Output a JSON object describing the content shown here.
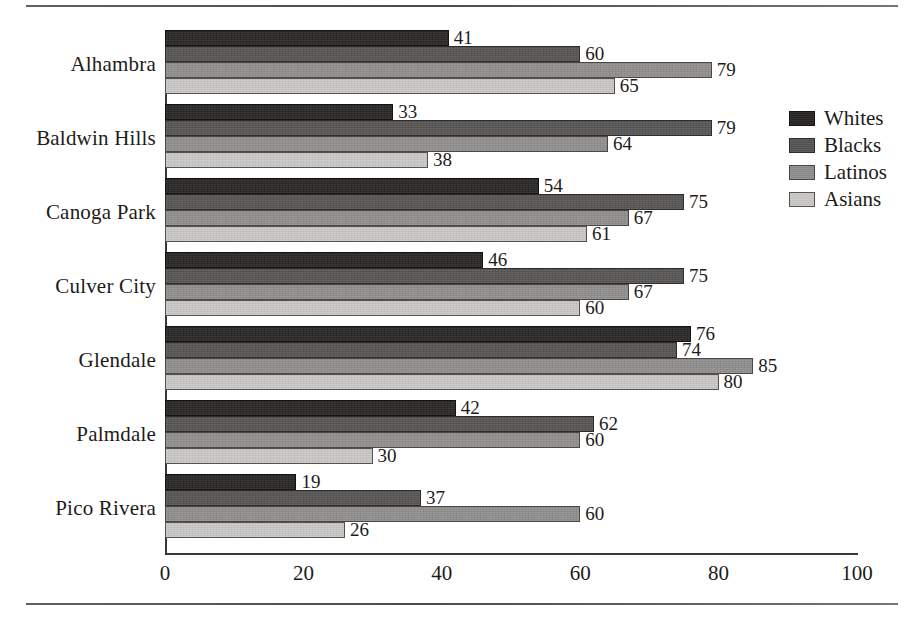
{
  "chart_data": {
    "type": "bar",
    "orientation": "horizontal",
    "title": "",
    "subtitle": "",
    "xlabel": "",
    "ylabel": "",
    "xlim": [
      0,
      100
    ],
    "xticks": [
      0,
      20,
      40,
      60,
      80,
      100
    ],
    "grid": false,
    "legend_position": "right",
    "categories": [
      "Alhambra",
      "Baldwin Hills",
      "Canoga Park",
      "Culver City",
      "Glendale",
      "Palmdale",
      "Pico Rivera"
    ],
    "series": [
      {
        "name": "Whites",
        "color": "#272523",
        "values": [
          41,
          33,
          54,
          46,
          76,
          42,
          19
        ]
      },
      {
        "name": "Blacks",
        "color": "#565452",
        "values": [
          60,
          79,
          75,
          75,
          74,
          62,
          37
        ]
      },
      {
        "name": "Latinos",
        "color": "#918f8d",
        "values": [
          79,
          64,
          67,
          67,
          85,
          60,
          60
        ]
      },
      {
        "name": "Asians",
        "color": "#cbc9c7",
        "values": [
          65,
          38,
          61,
          60,
          80,
          30,
          26
        ]
      }
    ],
    "data_labels": [
      {
        "category": "Alhambra",
        "Whites": 41,
        "Blacks": 60,
        "Latinos": 79,
        "Asians": 65
      },
      {
        "category": "Baldwin Hills",
        "Whites": 33,
        "Blacks": 79,
        "Latinos": 64,
        "Asians": 38
      },
      {
        "category": "Canoga Park",
        "Whites": 54,
        "Blacks": 75,
        "Latinos": 67,
        "Asians": 61
      },
      {
        "category": "Culver City",
        "Whites": 46,
        "Blacks": 75,
        "Latinos": 67,
        "Asians": 60
      },
      {
        "category": "Glendale",
        "Whites": 76,
        "Blacks": 74,
        "Latinos": 85,
        "Asians": 80
      },
      {
        "category": "Palmdale",
        "Whites": 42,
        "Blacks": 62,
        "Latinos": 60,
        "Asians": 30
      },
      {
        "category": "Pico Rivera",
        "Whites": 19,
        "Blacks": 37,
        "Latinos": 60,
        "Asians": 26
      }
    ]
  },
  "legend": {
    "items": [
      {
        "label": "Whites",
        "color": "#272523"
      },
      {
        "label": "Blacks",
        "color": "#565452"
      },
      {
        "label": "Latinos",
        "color": "#918f8d"
      },
      {
        "label": "Asians",
        "color": "#cbc9c7"
      }
    ]
  }
}
